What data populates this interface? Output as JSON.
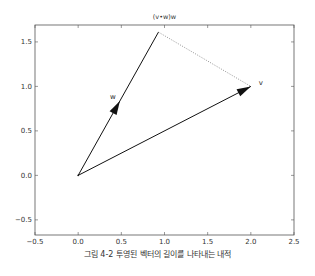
{
  "chart_data": {
    "type": "line",
    "title": "(v•w)w",
    "xlabel": "",
    "ylabel": "",
    "xlim": [
      -0.5,
      2.5
    ],
    "ylim": [
      -0.67,
      1.69
    ],
    "grid": false,
    "x_ticks": [
      -0.5,
      0.0,
      0.5,
      1.0,
      1.5,
      2.0,
      2.5
    ],
    "x_tick_labels": [
      "−0.5",
      "0.0",
      "0.5",
      "1.0",
      "1.5",
      "2.0",
      "2.5"
    ],
    "y_ticks": [
      -0.5,
      0.0,
      0.5,
      1.0,
      1.5
    ],
    "y_tick_labels": [
      "−0.5",
      "0.0",
      "0.5",
      "1.0",
      "1.5"
    ],
    "vectors": [
      {
        "name": "v",
        "from": [
          0,
          0
        ],
        "to": [
          2.0,
          1.0
        ],
        "style": "solid-arrow",
        "label": "v"
      },
      {
        "name": "w",
        "from": [
          0,
          0
        ],
        "to": [
          0.93,
          1.61
        ],
        "style": "solid-arrow",
        "label": "w"
      }
    ],
    "segments": [
      {
        "name": "projection-gap",
        "from": [
          0.93,
          1.61
        ],
        "to": [
          2.0,
          1.0
        ],
        "style": "dotted"
      }
    ],
    "caption": "그림 4-2 투영된 벡터의 길이를 나타내는 내적"
  },
  "caption": "그림 4-2 투영된 벡터의 길이를 나타내는 내적"
}
